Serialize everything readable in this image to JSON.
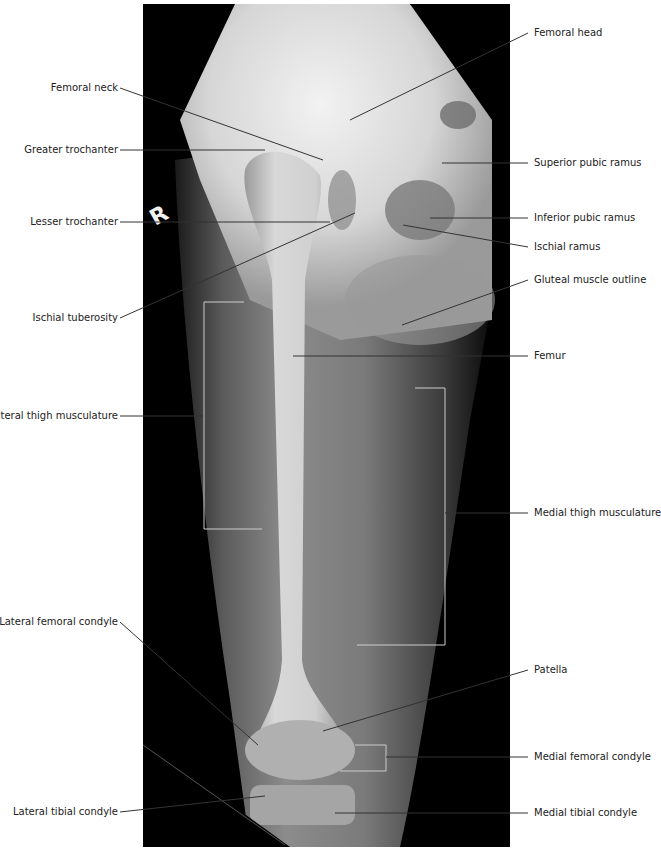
{
  "figure": {
    "type": "radiograph",
    "side_marker": "R",
    "colors": {
      "background": "#000000",
      "bone": "#e8e8e8",
      "soft_tissue": "#8a8a8a",
      "leader_line_on_image": "#d0d0d0",
      "leader_line_off_image": "#333333",
      "label_text": "#222222"
    }
  },
  "labels": {
    "left": [
      {
        "id": "femoral-neck",
        "text": "Femoral neck"
      },
      {
        "id": "greater-trochanter",
        "text": "Greater trochanter"
      },
      {
        "id": "lesser-trochanter",
        "text": "Lesser trochanter"
      },
      {
        "id": "ischial-tuberosity",
        "text": "Ischial tuberosity"
      },
      {
        "id": "lateral-thigh-musculature",
        "text": "Lateral thigh musculature"
      },
      {
        "id": "lateral-femoral-condyle",
        "text": "Lateral femoral condyle"
      },
      {
        "id": "lateral-tibial-condyle",
        "text": "Lateral tibial condyle"
      }
    ],
    "right": [
      {
        "id": "femoral-head",
        "text": "Femoral head"
      },
      {
        "id": "superior-pubic-ramus",
        "text": "Superior pubic ramus"
      },
      {
        "id": "inferior-pubic-ramus",
        "text": "Inferior pubic ramus"
      },
      {
        "id": "ischial-ramus",
        "text": "Ischial ramus"
      },
      {
        "id": "gluteal-muscle-outline",
        "text": "Gluteal muscle outline"
      },
      {
        "id": "femur",
        "text": "Femur"
      },
      {
        "id": "medial-thigh-musculature",
        "text": "Medial thigh musculature"
      },
      {
        "id": "patella",
        "text": "Patella"
      },
      {
        "id": "medial-femoral-condyle",
        "text": "Medial femoral condyle"
      },
      {
        "id": "medial-tibial-condyle",
        "text": "Medial tibial condyle"
      }
    ]
  }
}
